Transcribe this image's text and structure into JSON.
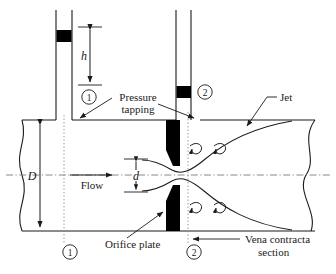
{
  "figure": {
    "type": "engineering-schematic"
  },
  "colors": {
    "line": "#1a1a1a",
    "plate_fill": "#000000",
    "mercury_fill": "#000000",
    "dotted": "#6e6e6e",
    "centerline": "#6e6e6e",
    "background": "#ffffff"
  },
  "labels": {
    "h": "h",
    "D": "D",
    "d": "d",
    "flow": "Flow",
    "pressure_tapping_line1": "Pressure",
    "pressure_tapping_line2": "tapping",
    "jet": "Jet",
    "orifice_plate": "Orifice plate",
    "vena_line1": "Vena contracta",
    "vena_line2": "section",
    "section_1_top": "1",
    "section_1_bottom": "1",
    "section_2_top": "2",
    "section_2_bottom": "2"
  },
  "annotations": [
    {
      "name": "manometer-height",
      "text": "h",
      "kind": "dimension",
      "italic": true
    },
    {
      "name": "pipe-diameter",
      "text": "D",
      "kind": "dimension",
      "italic": true
    },
    {
      "name": "orifice-diameter",
      "text": "d",
      "kind": "dimension",
      "italic": true
    },
    {
      "name": "flow-direction",
      "text": "Flow",
      "kind": "arrow-label",
      "italic": false
    },
    {
      "name": "pressure-tapping",
      "text": "Pressure tapping",
      "kind": "leader-label",
      "italic": false
    },
    {
      "name": "jet",
      "text": "Jet",
      "kind": "leader-label",
      "italic": false
    },
    {
      "name": "orifice-plate",
      "text": "Orifice plate",
      "kind": "leader-label",
      "italic": false
    },
    {
      "name": "vena-contracta",
      "text": "Vena contracta section",
      "kind": "leader-label",
      "italic": false
    }
  ],
  "sections": [
    {
      "id": "1",
      "position": "upstream",
      "markers": [
        "top",
        "bottom"
      ]
    },
    {
      "id": "2",
      "position": "vena-contracta",
      "markers": [
        "top",
        "bottom"
      ]
    }
  ]
}
